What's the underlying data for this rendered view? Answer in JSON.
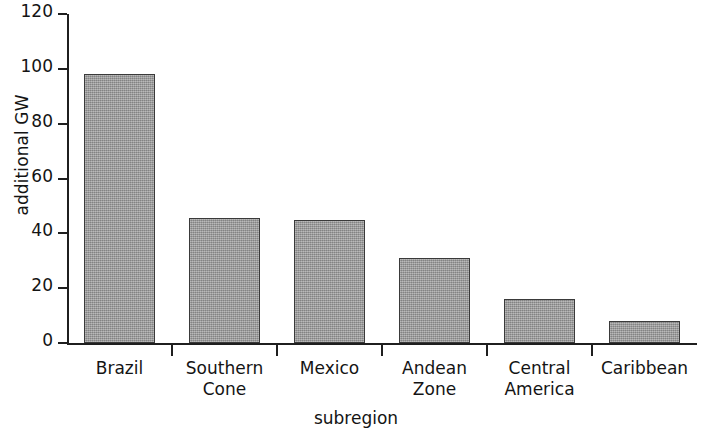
{
  "chart_data": {
    "type": "bar",
    "title": "",
    "xlabel": "subregion",
    "ylabel": "additional GW",
    "categories": [
      "Brazil",
      "Southern Cone",
      "Mexico",
      "Andean Zone",
      "Central America",
      "Caribbean"
    ],
    "category_lines": [
      [
        "Brazil"
      ],
      [
        "Southern",
        "Cone"
      ],
      [
        "Mexico"
      ],
      [
        "Andean",
        "Zone"
      ],
      [
        "Central",
        "America"
      ],
      [
        "Caribbean"
      ]
    ],
    "values": [
      98,
      45.5,
      45,
      31,
      16,
      8
    ],
    "ylim": [
      0,
      120
    ],
    "yticks": [
      0,
      20,
      40,
      60,
      80,
      100,
      120
    ],
    "ytick_labels": [
      "0",
      "20",
      "40",
      "60",
      "80",
      "100",
      "120"
    ],
    "grid": false,
    "legend": false,
    "bar_color": "#a0a0a0",
    "bar_edge_color": "#3a3a3a",
    "axis_color": "#1f1f1f"
  }
}
